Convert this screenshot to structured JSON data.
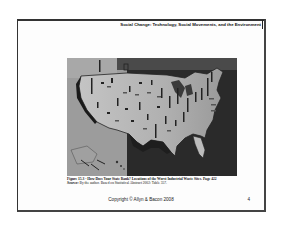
{
  "slide": {
    "header_title": "Social Change: Technology, Social Movements, and the Environment",
    "figure": {
      "image_alt": "Map of the United States showing locations of the worst industrial waste sites",
      "caption_title": "Figure 15.3 - How Does Your State Rank? Locations of the Worst Industrial Waste Sites.",
      "caption_page": "Page 422",
      "source_label": "Source:",
      "source_text": "By the author. Based on Statistical Abstract 2002: Table 357."
    },
    "footer": {
      "copyright": "Copyright © Allyn & Bacon 2008",
      "page_number": "4"
    }
  },
  "colors": {
    "map_water": "#2a2a2a",
    "map_land": "#b8b8b8",
    "frame": "#333333"
  }
}
